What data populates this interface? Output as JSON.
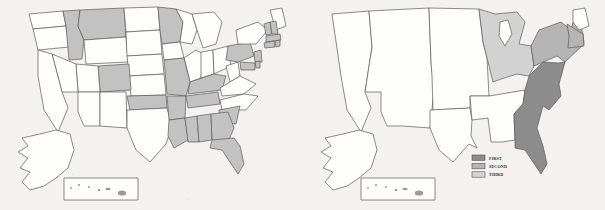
{
  "figure": {
    "type": "choropleth-map-pair",
    "background_color": "#f4f2ee",
    "panel_count": 2
  },
  "colors": {
    "outline": "#5a5a5a",
    "unshaded": "#fdfdfb",
    "first": "#8c8c8c",
    "second": "#b4b4b4",
    "third": "#d2d2d2",
    "left_shade": "#c2c2c2",
    "legend_border": "#4a4a4a",
    "text": "#2a2a2a"
  },
  "left_map": {
    "name": "state-level-choropleth",
    "shading_levels": 1,
    "has_legend": false,
    "has_alaska": true,
    "has_hawaii_inset": true,
    "shaded_states": [
      "Idaho",
      "Montana",
      "Colorado",
      "Oklahoma",
      "Minnesota",
      "Missouri",
      "Arkansas",
      "Louisiana",
      "Mississippi",
      "Alabama",
      "Georgia",
      "Florida",
      "South Carolina",
      "Tennessee",
      "Kentucky",
      "Pennsylvania",
      "New Jersey",
      "Connecticut",
      "Rhode Island",
      "Massachusetts",
      "Vermont",
      "New Hampshire",
      "Delaware",
      "Maryland"
    ],
    "unshaded_states": [
      "Washington",
      "Oregon",
      "California",
      "Nevada",
      "Utah",
      "Arizona",
      "Wyoming",
      "North Dakota",
      "South Dakota",
      "Nebraska",
      "Kansas",
      "New Mexico",
      "Texas",
      "Iowa",
      "Wisconsin",
      "Michigan",
      "Illinois",
      "Indiana",
      "Ohio",
      "West Virginia",
      "Virginia",
      "North Carolina",
      "New York",
      "Maine",
      "Alaska",
      "Hawaii"
    ]
  },
  "right_map": {
    "name": "regional-choropleth",
    "shading_levels": 3,
    "has_legend": true,
    "has_alaska": true,
    "has_hawaii_inset": true,
    "regions": [
      {
        "name": "South Atlantic",
        "rank": "FIRST",
        "shade": "first"
      },
      {
        "name": "Middle Atlantic",
        "rank": "SECOND",
        "shade": "second"
      },
      {
        "name": "East North Central",
        "rank": "THIRD",
        "shade": "third"
      }
    ]
  },
  "legend": {
    "name": "rank-legend",
    "position": "bottom-right",
    "items": [
      {
        "label": "FIRST",
        "shade": "first"
      },
      {
        "label": "SECOND",
        "shade": "second"
      },
      {
        "label": "THIRD",
        "shade": "third"
      }
    ]
  }
}
